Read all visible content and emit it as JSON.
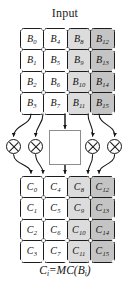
{
  "figure": {
    "title": "Input",
    "caption": {
      "lhs_symbol": "C",
      "lhs_sub": "i",
      "equals": "=",
      "func": "MC",
      "open_paren": "(",
      "arg_symbol": "B",
      "arg_sub": "i",
      "close_paren": ")",
      "full_text": "Ci = MC(Bi)"
    }
  },
  "colors": {
    "stroke": "#1c1c1c",
    "shade_0": "#ffffff",
    "shade_1": "#fbfbfb",
    "shade_2": "#dcdcdc",
    "shade_3": "#c4c4c4",
    "box_border": "#8d8d8d",
    "background": "#ffffff"
  },
  "input_matrix": {
    "name": "input-state-matrix",
    "rows": 4,
    "cols": 4,
    "order": "column-major",
    "cells": [
      {
        "symbol": "B",
        "index": "0",
        "shade": 0
      },
      {
        "symbol": "B",
        "index": "4",
        "shade": 0
      },
      {
        "symbol": "B",
        "index": "8",
        "shade": 2
      },
      {
        "symbol": "B",
        "index": "12",
        "shade": 3
      },
      {
        "symbol": "B",
        "index": "1",
        "shade": 0
      },
      {
        "symbol": "B",
        "index": "5",
        "shade": 0
      },
      {
        "symbol": "B",
        "index": "9",
        "shade": 2
      },
      {
        "symbol": "B",
        "index": "13",
        "shade": 3
      },
      {
        "symbol": "B",
        "index": "2",
        "shade": 0
      },
      {
        "symbol": "B",
        "index": "6",
        "shade": 0
      },
      {
        "symbol": "B",
        "index": "10",
        "shade": 2
      },
      {
        "symbol": "B",
        "index": "14",
        "shade": 3
      },
      {
        "symbol": "B",
        "index": "3",
        "shade": 0
      },
      {
        "symbol": "B",
        "index": "7",
        "shade": 0
      },
      {
        "symbol": "B",
        "index": "11",
        "shade": 2
      },
      {
        "symbol": "B",
        "index": "15",
        "shade": 3
      }
    ]
  },
  "output_matrix": {
    "name": "output-state-matrix",
    "rows": 4,
    "cols": 4,
    "order": "column-major",
    "cells": [
      {
        "symbol": "C",
        "index": "0",
        "shade": 0
      },
      {
        "symbol": "C",
        "index": "4",
        "shade": 0
      },
      {
        "symbol": "C",
        "index": "8",
        "shade": 2
      },
      {
        "symbol": "C",
        "index": "12",
        "shade": 3
      },
      {
        "symbol": "C",
        "index": "1",
        "shade": 0
      },
      {
        "symbol": "C",
        "index": "5",
        "shade": 0
      },
      {
        "symbol": "C",
        "index": "9",
        "shade": 2
      },
      {
        "symbol": "C",
        "index": "13",
        "shade": 3
      },
      {
        "symbol": "C",
        "index": "2",
        "shade": 0
      },
      {
        "symbol": "C",
        "index": "6",
        "shade": 0
      },
      {
        "symbol": "C",
        "index": "10",
        "shade": 2
      },
      {
        "symbol": "C",
        "index": "14",
        "shade": 3
      },
      {
        "symbol": "C",
        "index": "3",
        "shade": 0
      },
      {
        "symbol": "C",
        "index": "7",
        "shade": 0
      },
      {
        "symbol": "C",
        "index": "11",
        "shade": 2
      },
      {
        "symbol": "C",
        "index": "15",
        "shade": 3
      }
    ]
  },
  "operators": [
    {
      "name": "multiply-operator-1",
      "glyph": "circled-times",
      "x": 6,
      "y": 139
    },
    {
      "name": "multiply-operator-2",
      "glyph": "circled-times",
      "x": 28,
      "y": 139
    },
    {
      "name": "multiply-operator-3",
      "glyph": "circled-times",
      "x": 85,
      "y": 139
    },
    {
      "name": "multiply-operator-4",
      "glyph": "circled-times",
      "x": 107,
      "y": 139
    }
  ],
  "transform_box": {
    "name": "mixcolumns-transform-box",
    "arrows": 2,
    "arrow_style": "double-headed-vertical"
  }
}
